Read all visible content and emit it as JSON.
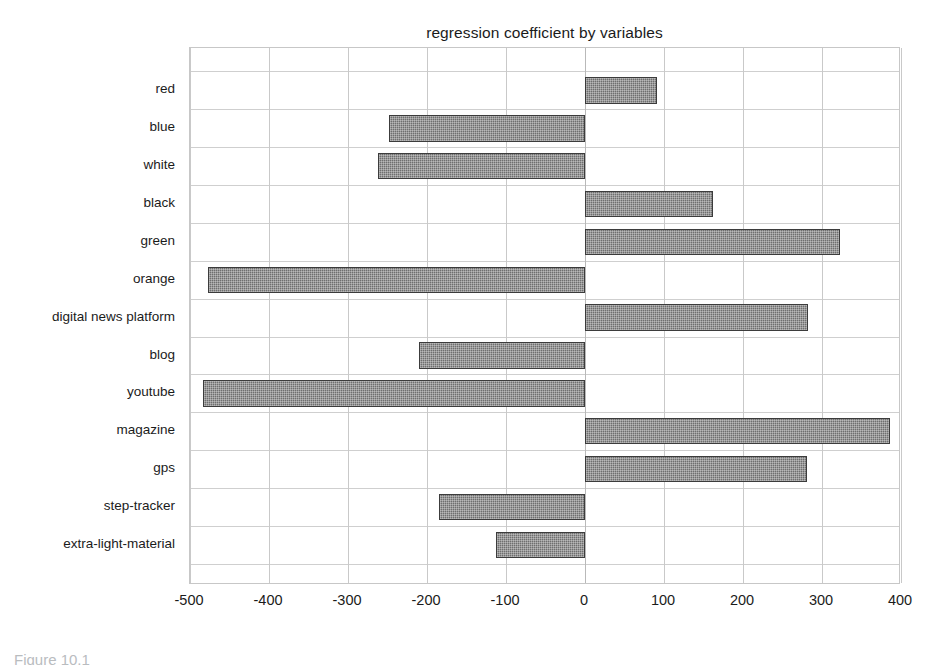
{
  "figure": {
    "caption_partial": "Figure 10.1"
  },
  "chart_data": {
    "type": "bar",
    "orientation": "horizontal",
    "title": "regression coefficient by variables",
    "xlabel": "",
    "ylabel": "",
    "categories": [
      "red",
      "blue",
      "white",
      "black",
      "green",
      "orange",
      "digital news platform",
      "blog",
      "youtube",
      "magazine",
      "gps",
      "step-tracker",
      "extra-light-material"
    ],
    "values": [
      91,
      -248,
      -262,
      162,
      323,
      -477,
      282,
      -210,
      -484,
      386,
      281,
      -185,
      -113
    ],
    "series": [
      {
        "name": "regression coefficient",
        "values": [
          91,
          -248,
          -262,
          162,
          323,
          -477,
          282,
          -210,
          -484,
          386,
          281,
          -185,
          -113
        ]
      }
    ],
    "xlim": [
      -500,
      400
    ],
    "xticks": [
      -500,
      -400,
      -300,
      -200,
      -100,
      0,
      100,
      200,
      300,
      400
    ],
    "xtick_labels": [
      "-500",
      "-400",
      "-300",
      "-200",
      "-100",
      "0",
      "100",
      "200",
      "300",
      "400"
    ],
    "grid": true,
    "legend": null,
    "bar_color": "#6f6f6f",
    "bar_edge_color": "#3c3c3c",
    "grid_color": "#c9c9c9",
    "background_color": "#ffffff"
  }
}
